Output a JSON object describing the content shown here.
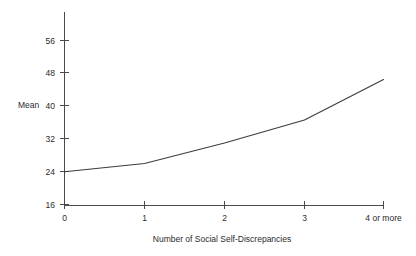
{
  "chart_data": {
    "type": "line",
    "title": "",
    "subtitle": "",
    "xlabel": "Number of Social Self-Discrepancies",
    "ylabel": "Mean",
    "categories": [
      "0",
      "1",
      "2",
      "3",
      "4 or more"
    ],
    "values": [
      24,
      26,
      31,
      36.6,
      46.5
    ],
    "series": [
      {
        "name": "Mean",
        "values": [
          24,
          26,
          31,
          36.6,
          46.5
        ]
      }
    ],
    "ylim": [
      16,
      60
    ],
    "yticks": [
      16,
      24,
      32,
      40,
      48,
      56
    ],
    "ytick_labels": [
      "16",
      "24",
      "32",
      "40",
      "48",
      "56"
    ],
    "xticks": [
      "0",
      "1",
      "2",
      "3",
      "4 or more"
    ],
    "grid": false,
    "legend": false,
    "legend_position": "none",
    "line_color": "#3b3b3b",
    "axis_color": "#4a4a4a",
    "background_color": "#ffffff",
    "markers": false,
    "annotations": []
  }
}
